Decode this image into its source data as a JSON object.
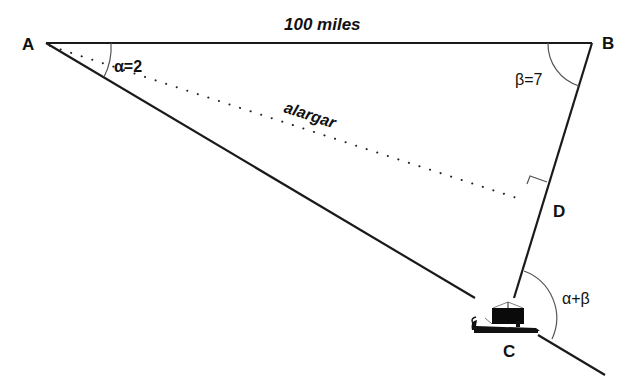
{
  "diagram": {
    "vertices": {
      "A": {
        "label": "A",
        "x": 46,
        "y": 43
      },
      "B": {
        "label": "B",
        "x": 592,
        "y": 43
      },
      "C": {
        "label": "C",
        "x": 514,
        "y": 305
      },
      "D": {
        "label": "D",
        "x": 525,
        "y": 198
      }
    },
    "labels": {
      "distance_ab": "100 miles",
      "alpha": "α=2",
      "beta": "β=7",
      "alpha_plus_beta": "α+β",
      "dotted_line": "alargar"
    },
    "icons": {
      "ship": "ancient-galley-ship"
    },
    "colors": {
      "line": "#1a1a1a",
      "arc": "#555555",
      "background": "#ffffff"
    }
  }
}
